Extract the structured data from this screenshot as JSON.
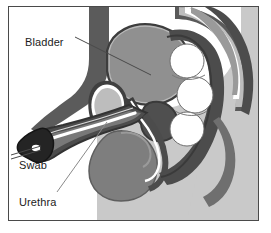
{
  "figure": {
    "type": "anatomical-diagram",
    "background_color": "#ffffff",
    "frame_color": "#4a4a4a",
    "labels": [
      {
        "id": "bladder",
        "text": "Bladder"
      },
      {
        "id": "swab",
        "text": "Swab"
      },
      {
        "id": "urethra",
        "text": "Urethra"
      }
    ],
    "palette": {
      "body_silhouette": "#c8c8c8",
      "tissue_dark": "#585858",
      "tissue_mid": "#808080",
      "tissue_light": "#b4b4b4",
      "organ_fill": "#8e8e8e",
      "bone_light": "#bdbdbd",
      "lumen_white": "#ffffff",
      "outline": "#3a3a3a",
      "swab_dark": "#2b2b2b",
      "leader_line": "#555555"
    },
    "structures": [
      {
        "name": "abdominal-wall",
        "tone": "tissue_dark"
      },
      {
        "name": "bladder",
        "tone": "organ_fill"
      },
      {
        "name": "pubic-bone",
        "tone": "bone_light"
      },
      {
        "name": "penis-shaft",
        "tone": "tissue_dark"
      },
      {
        "name": "urethra-channel",
        "tone": "lumen_white"
      },
      {
        "name": "glans-swab-tip",
        "tone": "swab_dark"
      },
      {
        "name": "scrotum-testis",
        "tone": "tissue_mid"
      },
      {
        "name": "prostate",
        "tone": "tissue_dark"
      },
      {
        "name": "rectum",
        "tone": "tissue_dark"
      },
      {
        "name": "rectal-contents",
        "tone": "lumen_white"
      },
      {
        "name": "sacrum-spine",
        "tone": "bone_light"
      },
      {
        "name": "buttock-silhouette",
        "tone": "body_silhouette"
      }
    ]
  }
}
